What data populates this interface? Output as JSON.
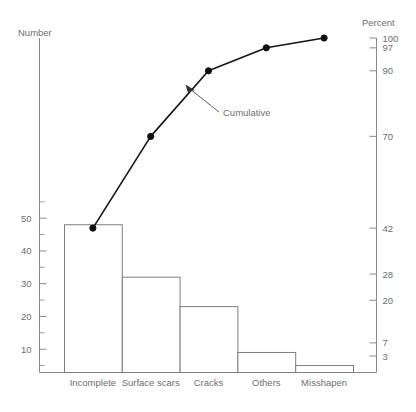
{
  "chart_data": {
    "type": "bar",
    "title": "",
    "subtitle": "",
    "xlabel": "",
    "ylabel": "Number",
    "y2label": "Percent",
    "grid": false,
    "legend_position": "none",
    "categories": [
      "Incomplete",
      "Surface scars",
      "Cracks",
      "Others",
      "Misshapen"
    ],
    "series": [
      {
        "name": "Number",
        "type": "bar",
        "values": [
          48,
          32,
          23,
          9,
          5
        ]
      },
      {
        "name": "Cumulative",
        "type": "line",
        "axis": "right",
        "values": [
          42,
          70,
          90,
          97,
          100
        ]
      }
    ],
    "ylim": [
      0,
      115
    ],
    "y2lim": [
      0,
      100
    ],
    "yticks": [
      10,
      20,
      30,
      40,
      50
    ],
    "ytick_labels": [
      "10",
      "20",
      "30",
      "40",
      "50"
    ],
    "y2ticks": [
      3,
      7,
      20,
      28,
      42,
      70,
      90,
      97,
      100
    ],
    "y2tick_labels": [
      "3",
      "7",
      "20",
      "28",
      "42",
      "70",
      "90",
      "97",
      "100"
    ],
    "annotations": [
      {
        "text": "Cumulative",
        "target_series": "Cumulative"
      }
    ]
  },
  "axes": {
    "left_title": "Number",
    "right_title": "Percent"
  },
  "annotation": {
    "cumulative_label": "Cumulative"
  },
  "ticks_left": [
    {
      "label": "50",
      "value": 50
    },
    {
      "label": "40",
      "value": 40
    },
    {
      "label": "30",
      "value": 30
    },
    {
      "label": "20",
      "value": 20
    },
    {
      "label": "10",
      "value": 10
    }
  ],
  "ticks_right": [
    {
      "label": "100",
      "value": 100
    },
    {
      "label": "97",
      "value": 97
    },
    {
      "label": "90",
      "value": 90
    },
    {
      "label": "70",
      "value": 70
    },
    {
      "label": "42",
      "value": 42
    },
    {
      "label": "28",
      "value": 28
    },
    {
      "label": "20",
      "value": 20
    },
    {
      "label": "7",
      "value": 7
    },
    {
      "label": "3",
      "value": 3
    }
  ],
  "categories": [
    {
      "label": "Incomplete"
    },
    {
      "label": "Surface scars"
    },
    {
      "label": "Cracks"
    },
    {
      "label": "Others"
    },
    {
      "label": "Misshapen"
    }
  ]
}
